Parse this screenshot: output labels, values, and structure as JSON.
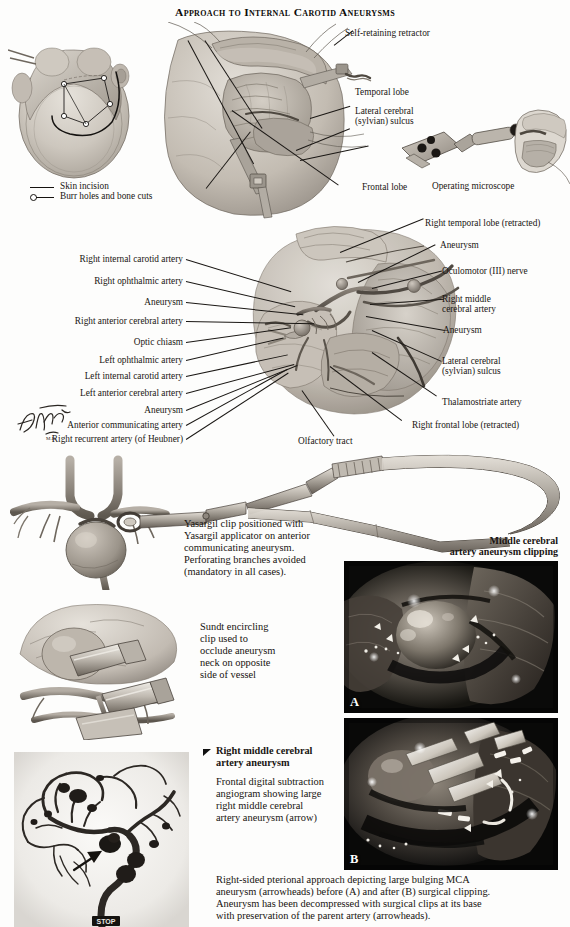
{
  "plate": {
    "title": "Approach to Internal Carotid Aneurysms",
    "signature": "F. Netter"
  },
  "top_panel": {
    "labels": [
      {
        "id": "self-retaining-retractor",
        "text": "Self-retaining retractor"
      },
      {
        "id": "temporal-lobe",
        "text": "Temporal lobe"
      },
      {
        "id": "lateral-cerebral-sulcus-l1",
        "text": "Lateral cerebral"
      },
      {
        "id": "lateral-cerebral-sulcus-l2",
        "text": "(sylvian) sulcus"
      },
      {
        "id": "frontal-lobe",
        "text": "Frontal lobe"
      },
      {
        "id": "operating-microscope",
        "text": "Operating microscope"
      }
    ],
    "legend": [
      {
        "id": "skin-incision",
        "text": "Skin incision",
        "marker": "solid-line"
      },
      {
        "id": "burr-holes",
        "text": "Burr holes and bone cuts",
        "marker": "circle-line"
      }
    ]
  },
  "middle_panel": {
    "left_labels": [
      "Right internal carotid artery",
      "Right ophthalmic artery",
      "Aneurysm",
      "Right anterior cerebral artery",
      "Optic chiasm",
      "Left ophthalmic artery",
      "Left internal carotid artery",
      "Left anterior cerebral artery",
      "Aneurysm",
      "Anterior communicating artery",
      "Right recurrent artery (of Heubner)"
    ],
    "right_labels": [
      "Right temporal lobe (retracted)",
      "Aneurysm",
      "Oculomotor  (III) nerve",
      "Right middle",
      "cerebral artery",
      "Aneurysm",
      "Lateral cerebral",
      "(sylvian) sulcus",
      "Thalamostriate artery",
      "Right frontal lobe (retracted)",
      "Olfactory tract"
    ]
  },
  "clip_panel": {
    "yasargil_caption": [
      "Yasargil clip positioned with",
      "Yasargil applicator on anterior",
      "communicating aneurysm.",
      "Perforating branches avoided",
      "(mandatory in all cases)."
    ],
    "sundt_caption": [
      "Sundt encircling",
      "clip used to",
      "occlude aneurysm",
      "neck on opposite",
      "side of vessel"
    ]
  },
  "photo_panel": {
    "heading_line1": "Middle cerebral",
    "heading_line2": "artery aneurysm clipping",
    "photo_a_label": "A",
    "photo_b_label": "B",
    "footer_caption": [
      "Right-sided pterional approach depicting large bulging MCA",
      "aneurysm (arrowheads) before (A) and after (B) surgical clipping.",
      "Aneurysm has been decompressed with surgical clips at its base",
      "with preservation of the parent artery (arrowheads)."
    ]
  },
  "angiogram_panel": {
    "heading_line1": "Right middle cerebral",
    "heading_line2": "artery aneurysm",
    "body": [
      "Frontal digital subtraction",
      "angiogram showing large",
      "right middle cerebral",
      "artery aneurysm (arrow)"
    ],
    "marker": "STOP"
  },
  "colors": {
    "ink": "#191512",
    "tissue_light": "#d9d4cc",
    "tissue_mid": "#b3aca2",
    "tissue_dark": "#8b8379",
    "vessel": "#6e675e",
    "metal": "#a9a39a",
    "photo_bg": "#0b0b0b",
    "angio_bg": "#f2f1ee"
  }
}
